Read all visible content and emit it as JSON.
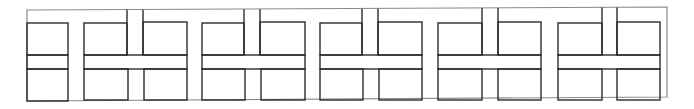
{
  "diagram": {
    "colors": {
      "background": "#ffffff",
      "frame": "#8a8a8a",
      "line": "#2b2b2b"
    },
    "frame": {
      "points": [
        [
          27,
          10
        ],
        [
          667,
          7
        ],
        [
          667,
          97
        ],
        [
          27,
          101
        ]
      ]
    },
    "left_column": {
      "x": 27,
      "w": 41,
      "rows": [
        [
          23,
          55
        ],
        [
          55,
          69
        ],
        [
          69,
          101
        ]
      ]
    },
    "blocks": [
      {
        "x": 84,
        "w": 103,
        "top_channel": [
          127,
          143
        ],
        "bottom_channel": [
          128,
          144
        ]
      },
      {
        "x": 202,
        "w": 103,
        "top_channel": [
          244,
          260
        ],
        "bottom_channel": [
          245,
          261
        ]
      },
      {
        "x": 320,
        "w": 102,
        "top_channel": [
          362,
          378
        ],
        "bottom_channel": [
          363,
          379
        ]
      },
      {
        "x": 438,
        "w": 103,
        "top_channel": [
          482,
          498
        ],
        "bottom_channel": [
          482,
          498
        ]
      },
      {
        "x": 558,
        "w": 102,
        "top_channel": [
          602,
          617
        ],
        "bottom_channel": [
          602,
          617
        ]
      }
    ],
    "band": {
      "top": 55,
      "bottom": 69
    },
    "box_top": 22,
    "box_bottom": 100
  }
}
